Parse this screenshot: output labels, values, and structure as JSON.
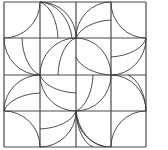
{
  "diagram": {
    "type": "quilt-block-pattern",
    "grid": {
      "cols": 4,
      "rows": 4,
      "x_lines": [
        4,
        40,
        76,
        111,
        146
      ],
      "y_lines": [
        2,
        38,
        75,
        111,
        147
      ]
    },
    "colors": {
      "line": "#3a3a3a",
      "grid": "#4a4a4a",
      "background": "#ffffff"
    },
    "arcs": [
      "M40 2 A36 36 0 0 1 4 38",
      "M40 2 A36 36 0 0 1 76 38",
      "M40 2 A34 42 0 0 1 72 38",
      "M40 2 A22 40 0 0 1 58 38",
      "M76 38 A35 36 0 0 1 111 2",
      "M76 38 A40 24 0 0 1 111 20",
      "M111 2 A35 36 0 0 0 146 38",
      "M4 38 A36 37 0 0 0 40 75",
      "M22 38 A24 40 0 0 0 40 75",
      "M76 38 A36 37 0 0 0 40 75",
      "M76 38 A22 40 0 0 0 58 75",
      "M76 38 A35 37 0 0 1 111 75",
      "M76 57 A40 24 0 0 0 111 75",
      "M146 38 A35 37 0 0 1 111 75",
      "M146 38 A40 22 0 0 1 111 57",
      "M4 111 A36 36 0 0 1 40 75",
      "M4 111 A40 22 0 0 1 40 93",
      "M40 75 A36 36 0 0 0 76 111",
      "M40 75 A40 22 0 0 0 76 93",
      "M76 111 A35 36 0 0 0 111 75",
      "M76 111 A22 40 0 0 0 93 75",
      "M111 75 A35 36 0 0 1 146 111",
      "M128 75 A24 40 0 0 1 146 111",
      "M4 111 A36 36 0 0 1 40 147",
      "M76 111 A36 36 0 0 1 40 147",
      "M76 111 A40 22 0 0 1 40 129",
      "M76 111 A35 36 0 0 0 111 147",
      "M76 111 A34 42 0 0 0 106 147",
      "M76 111 A22 40 0 0 0 93 147",
      "M146 111 A35 36 0 0 0 111 147"
    ]
  }
}
